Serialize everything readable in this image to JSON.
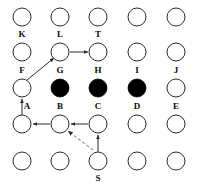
{
  "figure": {
    "background_color": "#ffffff",
    "node_stroke_color": "#2b2b2b",
    "node_fill_open": "#ffffff",
    "node_fill_blocked": "#000000",
    "edge_color": "#2b2b2b",
    "dashed_edge_color": "#8c8c8c",
    "label_color": "#0a0a0a",
    "width": 199,
    "height": 195
  },
  "grid": {
    "columns": 5,
    "rows": 5,
    "col_x": [
      22,
      60,
      98,
      137,
      176
    ],
    "row_y": [
      17,
      52,
      88,
      124,
      161
    ],
    "radius": 9
  },
  "nodes": [
    {
      "id": "r1c1",
      "label": "K",
      "col": 1,
      "row": 1,
      "state": "open"
    },
    {
      "id": "r1c2",
      "label": "L",
      "col": 2,
      "row": 1,
      "state": "open"
    },
    {
      "id": "r1c3",
      "label": "T",
      "col": 3,
      "row": 1,
      "state": "open"
    },
    {
      "id": "r1c4",
      "label": "",
      "col": 4,
      "row": 1,
      "state": "open"
    },
    {
      "id": "r1c5",
      "label": "",
      "col": 5,
      "row": 1,
      "state": "open"
    },
    {
      "id": "r2c1",
      "label": "F",
      "col": 1,
      "row": 2,
      "state": "open"
    },
    {
      "id": "r2c2",
      "label": "G",
      "col": 2,
      "row": 2,
      "state": "open"
    },
    {
      "id": "r2c3",
      "label": "H",
      "col": 3,
      "row": 2,
      "state": "open"
    },
    {
      "id": "r2c4",
      "label": "I",
      "col": 4,
      "row": 2,
      "state": "open"
    },
    {
      "id": "r2c5",
      "label": "J",
      "col": 5,
      "row": 2,
      "state": "open"
    },
    {
      "id": "r3c1",
      "label": "A",
      "col": 1,
      "row": 3,
      "state": "open"
    },
    {
      "id": "r3c2",
      "label": "B",
      "col": 2,
      "row": 3,
      "state": "blocked"
    },
    {
      "id": "r3c3",
      "label": "C",
      "col": 3,
      "row": 3,
      "state": "blocked"
    },
    {
      "id": "r3c4",
      "label": "D",
      "col": 4,
      "row": 3,
      "state": "blocked"
    },
    {
      "id": "r3c5",
      "label": "E",
      "col": 5,
      "row": 3,
      "state": "open"
    },
    {
      "id": "r4c1",
      "label": "",
      "col": 1,
      "row": 4,
      "state": "open"
    },
    {
      "id": "r4c2",
      "label": "",
      "col": 2,
      "row": 4,
      "state": "open"
    },
    {
      "id": "r4c3",
      "label": "",
      "col": 3,
      "row": 4,
      "state": "open"
    },
    {
      "id": "r4c4",
      "label": "",
      "col": 4,
      "row": 4,
      "state": "open"
    },
    {
      "id": "r4c5",
      "label": "",
      "col": 5,
      "row": 4,
      "state": "open"
    },
    {
      "id": "r5c1",
      "label": "",
      "col": 1,
      "row": 5,
      "state": "open"
    },
    {
      "id": "r5c2",
      "label": "",
      "col": 2,
      "row": 5,
      "state": "open"
    },
    {
      "id": "r5c3",
      "label": "S",
      "col": 3,
      "row": 5,
      "state": "open"
    },
    {
      "id": "r5c4",
      "label": "",
      "col": 4,
      "row": 5,
      "state": "open"
    },
    {
      "id": "r5c5",
      "label": "",
      "col": 5,
      "row": 5,
      "state": "open"
    }
  ],
  "labels": [
    {
      "text": "K",
      "x": 22,
      "y": 30
    },
    {
      "text": "L",
      "x": 60,
      "y": 30
    },
    {
      "text": "T",
      "x": 98,
      "y": 30
    },
    {
      "text": "F",
      "x": 22,
      "y": 66
    },
    {
      "text": "G",
      "x": 60,
      "y": 66
    },
    {
      "text": "H",
      "x": 98,
      "y": 66
    },
    {
      "text": "I",
      "x": 137,
      "y": 66
    },
    {
      "text": "J",
      "x": 176,
      "y": 66
    },
    {
      "text": "A",
      "x": 27,
      "y": 102
    },
    {
      "text": "B",
      "x": 60,
      "y": 102
    },
    {
      "text": "C",
      "x": 98,
      "y": 102
    },
    {
      "text": "D",
      "x": 137,
      "y": 102
    },
    {
      "text": "E",
      "x": 176,
      "y": 102
    },
    {
      "text": "S",
      "x": 98,
      "y": 174
    }
  ],
  "edges": [
    {
      "id": "edge-F-L",
      "from": "r3c1",
      "to": "r1c2",
      "style": "solid",
      "arrow": "end",
      "x1": 27,
      "y1": 80,
      "x2": 54,
      "y2": 58
    },
    {
      "id": "edge-L-T",
      "from": "r1c2",
      "to": "r1c3",
      "style": "solid",
      "arrow": "end",
      "x1": 70,
      "y1": 52,
      "x2": 88,
      "y2": 52
    },
    {
      "id": "edge-A-F",
      "from": "r3c1",
      "to": "r2c1",
      "style": "solid",
      "arrow": "end",
      "x1": 22,
      "y1": 115,
      "x2": 22,
      "y2": 99
    },
    {
      "id": "edge-B-A",
      "from": "r4c2",
      "to": "r4c1",
      "style": "solid",
      "arrow": "end",
      "x1": 50,
      "y1": 124,
      "x2": 33,
      "y2": 124
    },
    {
      "id": "edge-C-B",
      "from": "r4c3",
      "to": "r4c2",
      "style": "solid",
      "arrow": "end",
      "x1": 88,
      "y1": 124,
      "x2": 71,
      "y2": 124
    },
    {
      "id": "edge-S-C",
      "from": "r5c3",
      "to": "r4c3",
      "style": "solid",
      "arrow": "end",
      "x1": 98,
      "y1": 152,
      "x2": 98,
      "y2": 135
    },
    {
      "id": "edge-S-B",
      "from": "r5c3",
      "to": "r4c2",
      "style": "dashed",
      "arrow": "end",
      "x1": 93,
      "y1": 150,
      "x2": 68,
      "y2": 131
    }
  ]
}
